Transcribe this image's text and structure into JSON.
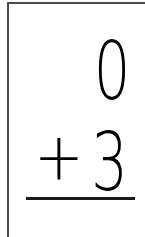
{
  "problem": {
    "operand_top": "0",
    "operator": "+",
    "operand_bottom": "3",
    "operation": "addition"
  },
  "colors": {
    "text": "#000000",
    "border": "#4a4a4a",
    "answer_line": "#1a1a1a",
    "background": "#ffffff"
  }
}
